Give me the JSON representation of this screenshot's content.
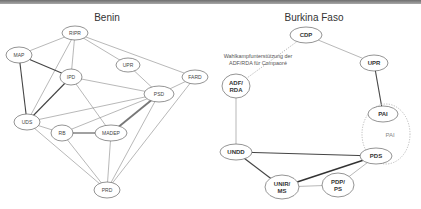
{
  "diagrams": [
    {
      "title": "Benin",
      "nodes": [
        {
          "id": "RIPR",
          "label": "RIPR",
          "x": 75,
          "y": 33,
          "rx": 13,
          "ry": 7
        },
        {
          "id": "MAP",
          "label": "MAP",
          "x": 19,
          "y": 55,
          "rx": 13,
          "ry": 8
        },
        {
          "id": "UPR",
          "label": "UPR",
          "x": 128,
          "y": 65,
          "rx": 12,
          "ry": 7
        },
        {
          "id": "IPD",
          "label": "IPD",
          "x": 71,
          "y": 77,
          "rx": 11,
          "ry": 8
        },
        {
          "id": "FARD",
          "label": "FARD",
          "x": 195,
          "y": 77,
          "rx": 13,
          "ry": 7
        },
        {
          "id": "PSD",
          "label": "PSD",
          "x": 159,
          "y": 94,
          "rx": 15,
          "ry": 8
        },
        {
          "id": "UDS",
          "label": "UDS",
          "x": 27,
          "y": 122,
          "rx": 13,
          "ry": 8
        },
        {
          "id": "RB",
          "label": "RB",
          "x": 62,
          "y": 133,
          "rx": 11,
          "ry": 8
        },
        {
          "id": "MADEP",
          "label": "MADEP",
          "x": 111,
          "y": 133,
          "rx": 16,
          "ry": 8
        },
        {
          "id": "PRD",
          "label": "PRD",
          "x": 107,
          "y": 190,
          "rx": 13,
          "ry": 8
        }
      ],
      "edges": [
        {
          "from": "RIPR",
          "to": "MAP",
          "style": "thin"
        },
        {
          "from": "RIPR",
          "to": "IPD",
          "style": "thin"
        },
        {
          "from": "RIPR",
          "to": "UPR",
          "style": "thin"
        },
        {
          "from": "RIPR",
          "to": "FARD",
          "style": "thin"
        },
        {
          "from": "RIPR",
          "to": "UDS",
          "style": "thin"
        },
        {
          "from": "MAP",
          "to": "IPD",
          "style": "strong"
        },
        {
          "from": "MAP",
          "to": "UDS",
          "style": "strong"
        },
        {
          "from": "IPD",
          "to": "UDS",
          "style": "strong"
        },
        {
          "from": "IPD",
          "to": "PSD",
          "style": "thin"
        },
        {
          "from": "IPD",
          "to": "MADEP",
          "style": "thin"
        },
        {
          "from": "UPR",
          "to": "PSD",
          "style": "thin"
        },
        {
          "from": "FARD",
          "to": "PSD",
          "style": "thin"
        },
        {
          "from": "FARD",
          "to": "PRD",
          "style": "thin"
        },
        {
          "from": "PSD",
          "to": "UDS",
          "style": "thin"
        },
        {
          "from": "PSD",
          "to": "RB",
          "style": "thin"
        },
        {
          "from": "PSD",
          "to": "MADEP",
          "style": "double"
        },
        {
          "from": "PSD",
          "to": "PRD",
          "style": "thin"
        },
        {
          "from": "UDS",
          "to": "RB",
          "style": "thin"
        },
        {
          "from": "UDS",
          "to": "PRD",
          "style": "thin"
        },
        {
          "from": "RB",
          "to": "MADEP",
          "style": "strong"
        },
        {
          "from": "RB",
          "to": "PRD",
          "style": "thin"
        },
        {
          "from": "MADEP",
          "to": "PRD",
          "style": "thin"
        }
      ]
    },
    {
      "title": "Burkina Faso",
      "nodes": [
        {
          "id": "CDP",
          "label": "CDP",
          "x": 306,
          "y": 35,
          "rx": 16,
          "ry": 8,
          "lines": [
            "CDP"
          ]
        },
        {
          "id": "UPR_BF",
          "label": "UPR",
          "x": 374,
          "y": 63,
          "rx": 14,
          "ry": 8,
          "lines": [
            "UPR"
          ]
        },
        {
          "id": "ADF_RDA",
          "label": "ADF/ RDA",
          "x": 236,
          "y": 86,
          "rx": 14,
          "ry": 12,
          "lines": [
            "ADF/",
            "RDA"
          ]
        },
        {
          "id": "PAI_node",
          "label": "PAI",
          "x": 383,
          "y": 114,
          "rx": 15,
          "ry": 8,
          "lines": [
            "PAI"
          ]
        },
        {
          "id": "UNDD",
          "label": "UNDD",
          "x": 236,
          "y": 152,
          "rx": 16,
          "ry": 8,
          "lines": [
            "UNDD"
          ]
        },
        {
          "id": "PDS",
          "label": "PDS",
          "x": 376,
          "y": 156,
          "rx": 16,
          "ry": 8,
          "lines": [
            "PDS"
          ]
        },
        {
          "id": "UNIR_MS",
          "label": "UNIR/ MS",
          "x": 282,
          "y": 187,
          "rx": 17,
          "ry": 12,
          "lines": [
            "UNIR/",
            "MS"
          ]
        },
        {
          "id": "PDP_PS",
          "label": "PDP/ PS",
          "x": 338,
          "y": 185,
          "rx": 16,
          "ry": 12,
          "lines": [
            "PDP/",
            "PS"
          ]
        }
      ],
      "group": {
        "label": "PAI",
        "x": 386,
        "y": 134,
        "rx": 24,
        "ry": 30
      },
      "annotation": {
        "lines": [
          "Wahlkampfunterstützung der",
          "ADF/RDA für Compaoré"
        ],
        "x": 258,
        "y": 58
      },
      "edges": [
        {
          "from": "CDP",
          "to": "UPR_BF",
          "style": "thin"
        },
        {
          "from": "CDP",
          "to": "ADF_RDA",
          "style": "dotted"
        },
        {
          "from": "UPR_BF",
          "to": "PAI_node",
          "style": "strong"
        },
        {
          "from": "ADF_RDA",
          "to": "UNDD",
          "style": "thin"
        },
        {
          "from": "UNDD",
          "to": "PDS",
          "style": "strong"
        },
        {
          "from": "UNDD",
          "to": "UNIR_MS",
          "style": "strong"
        },
        {
          "from": "UNIR_MS",
          "to": "PDS",
          "style": "strongest"
        },
        {
          "from": "UNIR_MS",
          "to": "PDP_PS",
          "style": "thin"
        },
        {
          "from": "PDP_PS",
          "to": "PDS",
          "style": "thin"
        }
      ]
    }
  ]
}
